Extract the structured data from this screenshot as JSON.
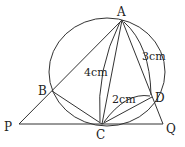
{
  "diagram": {
    "points": {
      "A": {
        "label": "A",
        "x": 122,
        "y": 20
      },
      "B": {
        "label": "B",
        "x": 52,
        "y": 91
      },
      "C": {
        "label": "C",
        "x": 102,
        "y": 124
      },
      "D": {
        "label": "D",
        "x": 152,
        "y": 97
      },
      "P": {
        "label": "P",
        "x": 19,
        "y": 124
      },
      "Q": {
        "label": "Q",
        "x": 163,
        "y": 124
      }
    },
    "circle": {
      "cx": 107,
      "cy": 73,
      "r": 54
    },
    "measurements": {
      "AC": "4cm",
      "AD": "3cm",
      "CD": "2cm"
    }
  }
}
